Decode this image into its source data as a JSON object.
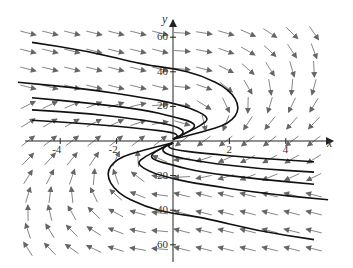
{
  "chart_data": {
    "type": "direction_field",
    "title": "",
    "xlabel": "x",
    "ylabel": "y",
    "xlim": [
      -5.5,
      5.5
    ],
    "ylim": [
      -65,
      65
    ],
    "x_ticks": [
      -4,
      -2,
      2,
      4
    ],
    "x_tick_labels": [
      "-4",
      "-2",
      "2",
      "4"
    ],
    "y_ticks": [
      60,
      40,
      20,
      -20,
      -40,
      -60
    ],
    "y_tick_labels": [
      "60",
      "40",
      "20",
      "20",
      "40",
      "60"
    ],
    "grid": false,
    "legend": null,
    "field_description": "Slope field; arrows point right in upper-left region, left in lower-right region, swirling near the origin",
    "solution_curves": [
      {
        "points": [
          [
            -5,
            57
          ],
          [
            -3,
            52
          ],
          [
            -1,
            44
          ],
          [
            0,
            42
          ],
          [
            1,
            38
          ],
          [
            2,
            30
          ],
          [
            2.4,
            19
          ],
          [
            2,
            10
          ],
          [
            1,
            5
          ],
          [
            0,
            1
          ]
        ]
      },
      {
        "points": [
          [
            -5.5,
            34
          ],
          [
            -3,
            30
          ],
          [
            -1,
            25
          ],
          [
            0,
            22
          ],
          [
            0.8,
            18
          ],
          [
            1.3,
            13
          ],
          [
            1,
            9
          ],
          [
            0.5,
            5
          ],
          [
            0,
            1
          ]
        ]
      },
      {
        "points": [
          [
            -5,
            25
          ],
          [
            -3,
            22
          ],
          [
            -1,
            18
          ],
          [
            0,
            14
          ],
          [
            0.7,
            11
          ],
          [
            0.8,
            8
          ],
          [
            0.4,
            4
          ],
          [
            0,
            1
          ]
        ]
      },
      {
        "points": [
          [
            -5,
            18
          ],
          [
            -3,
            16
          ],
          [
            -1,
            12
          ],
          [
            0,
            9
          ],
          [
            0.4,
            6
          ],
          [
            0.3,
            3
          ],
          [
            0,
            1
          ]
        ]
      },
      {
        "points": [
          [
            -5,
            12
          ],
          [
            -3,
            10
          ],
          [
            -1,
            7
          ],
          [
            0,
            5
          ],
          [
            0.2,
            3
          ],
          [
            0,
            1
          ]
        ]
      },
      {
        "points": [
          [
            5,
            -57
          ],
          [
            3,
            -52
          ],
          [
            1,
            -44
          ],
          [
            0,
            -42
          ],
          [
            -1,
            -38
          ],
          [
            -2,
            -30
          ],
          [
            -2.4,
            -19
          ],
          [
            -2,
            -10
          ],
          [
            -1,
            -5
          ],
          [
            0,
            -1
          ]
        ]
      },
      {
        "points": [
          [
            5.5,
            -34
          ],
          [
            3,
            -30
          ],
          [
            1,
            -25
          ],
          [
            0,
            -22
          ],
          [
            -0.8,
            -18
          ],
          [
            -1.3,
            -13
          ],
          [
            -1,
            -9
          ],
          [
            -0.5,
            -5
          ],
          [
            0,
            -1
          ]
        ]
      },
      {
        "points": [
          [
            5,
            -25
          ],
          [
            3,
            -22
          ],
          [
            1,
            -18
          ],
          [
            0,
            -14
          ],
          [
            -0.7,
            -11
          ],
          [
            -0.8,
            -8
          ],
          [
            -0.4,
            -4
          ],
          [
            0,
            -1
          ]
        ]
      },
      {
        "points": [
          [
            5,
            -18
          ],
          [
            3,
            -16
          ],
          [
            1,
            -12
          ],
          [
            0,
            -9
          ],
          [
            -0.4,
            -6
          ],
          [
            -0.3,
            -3
          ],
          [
            0,
            -1
          ]
        ]
      },
      {
        "points": [
          [
            5,
            -12
          ],
          [
            3,
            -10
          ],
          [
            1,
            -7
          ],
          [
            0,
            -5
          ],
          [
            -0.2,
            -3
          ],
          [
            0,
            -1
          ]
        ]
      }
    ]
  },
  "colors": {
    "arrow": "#777777",
    "curve": "#111111",
    "axis": "#333333"
  }
}
